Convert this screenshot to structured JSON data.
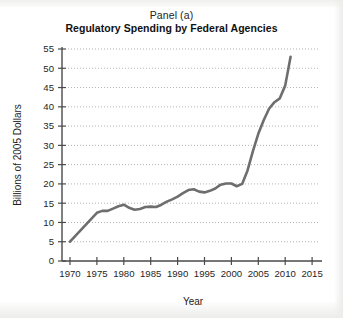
{
  "figure": {
    "panel_label": "Panel (a)",
    "title": "Regulatory Spending by Federal Agencies"
  },
  "axes": {
    "x_title": "Year",
    "y_title": "Billions of 2005 Dollars",
    "x_ticks": [
      "1970",
      "1975",
      "1980",
      "1985",
      "1990",
      "1995",
      "2000",
      "2005",
      "2010",
      "2015"
    ],
    "y_ticks": [
      "0",
      "5",
      "10",
      "15",
      "20",
      "25",
      "30",
      "35",
      "40",
      "45",
      "50",
      "55"
    ]
  },
  "style": {
    "line_color": "#6e6e6e",
    "axis_color": "#4a4a4a",
    "grid_color": "#9a9a9a",
    "background": "#ffffff"
  },
  "chart_data": {
    "type": "line",
    "title": "Regulatory Spending by Federal Agencies",
    "subtitle": "Panel (a)",
    "xlabel": "Year",
    "ylabel": "Billions of 2005 Dollars",
    "xlim": [
      1969,
      2017
    ],
    "ylim": [
      0,
      55
    ],
    "xticks": [
      1970,
      1975,
      1980,
      1985,
      1990,
      1995,
      2000,
      2005,
      2010,
      2015
    ],
    "yticks": [
      0,
      5,
      10,
      15,
      20,
      25,
      30,
      35,
      40,
      45,
      50,
      55
    ],
    "grid": "horizontal-dotted",
    "legend": "none",
    "series": [
      {
        "name": "Regulatory Spending",
        "x": [
          1970,
          1971,
          1972,
          1973,
          1974,
          1975,
          1976,
          1977,
          1978,
          1979,
          1980,
          1981,
          1982,
          1983,
          1984,
          1985,
          1986,
          1987,
          1988,
          1989,
          1990,
          1991,
          1992,
          1993,
          1994,
          1995,
          1996,
          1997,
          1998,
          1999,
          2000,
          2001,
          2002,
          2003,
          2004,
          2005,
          2006,
          2007,
          2008,
          2009,
          2010,
          2011
        ],
        "y": [
          5.0,
          6.5,
          8.0,
          9.5,
          11.0,
          12.5,
          13.0,
          13.0,
          13.6,
          14.2,
          14.6,
          13.8,
          13.3,
          13.5,
          14.0,
          14.1,
          14.0,
          14.6,
          15.4,
          16.0,
          16.7,
          17.6,
          18.4,
          18.6,
          18.0,
          17.8,
          18.2,
          18.8,
          19.8,
          20.1,
          20.1,
          19.4,
          20.0,
          23.5,
          28.5,
          33.0,
          36.5,
          39.5,
          41.2,
          42.2,
          45.5,
          53.0
        ]
      }
    ]
  }
}
